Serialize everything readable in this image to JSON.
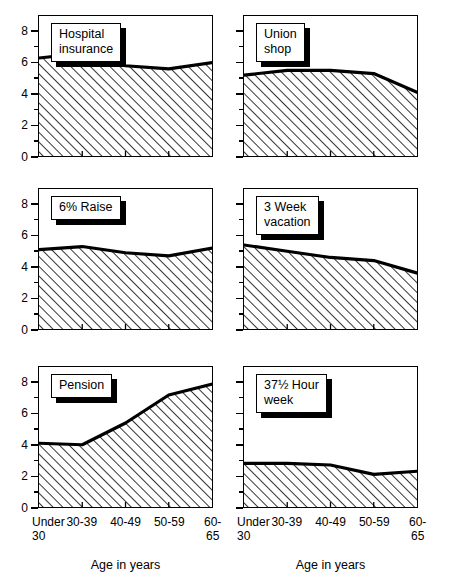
{
  "figure": {
    "axis_title": "Age in years",
    "categories": [
      "Under\n30",
      "30-39",
      "40-49",
      "50-59",
      "60-65"
    ],
    "y_ticks": [
      "0",
      "2",
      "4",
      "6",
      "8"
    ]
  },
  "chart_data": {
    "type": "area",
    "title": "",
    "xlabel": "Age in years",
    "ylabel": "",
    "ylim": [
      0,
      9
    ],
    "grid": false,
    "legend": "none",
    "categories": [
      "Under 30",
      "30-39",
      "40-49",
      "50-59",
      "60-65"
    ],
    "panels": [
      {
        "label": "Hospital\ninsurance",
        "row": 0,
        "col": 0,
        "values": [
          6.3,
          6.6,
          5.8,
          5.6,
          6.0
        ]
      },
      {
        "label": "Union\nshop",
        "row": 0,
        "col": 1,
        "values": [
          5.2,
          5.5,
          5.5,
          5.3,
          4.1
        ]
      },
      {
        "label": "6% Raise",
        "row": 1,
        "col": 0,
        "values": [
          5.1,
          5.3,
          4.9,
          4.7,
          5.2
        ]
      },
      {
        "label": "3 Week\nvacation",
        "row": 1,
        "col": 1,
        "values": [
          5.4,
          5.0,
          4.6,
          4.4,
          3.6
        ]
      },
      {
        "label": "Pension",
        "row": 2,
        "col": 0,
        "values": [
          4.1,
          4.0,
          5.4,
          7.2,
          7.9
        ]
      },
      {
        "label": "37½ Hour\nweek",
        "row": 2,
        "col": 1,
        "values": [
          2.8,
          2.8,
          2.7,
          2.1,
          2.3
        ]
      }
    ]
  }
}
